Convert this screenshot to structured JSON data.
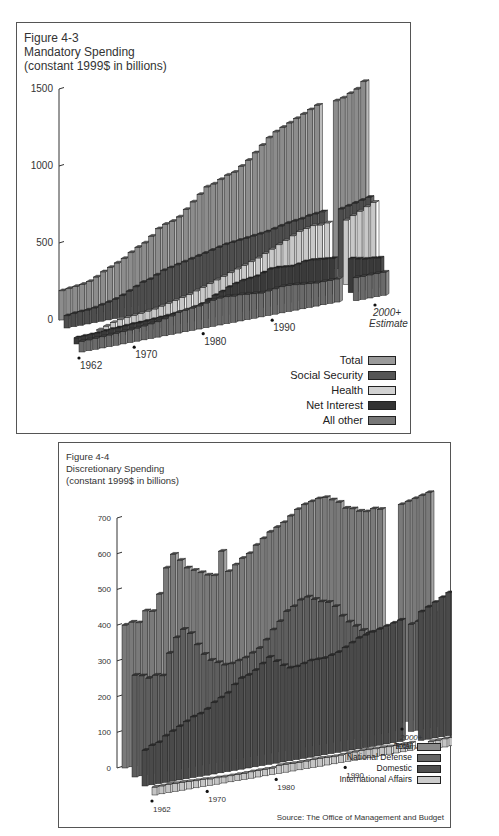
{
  "chart_data": [
    {
      "type": "bar",
      "style": "3d-stacked-depth",
      "figure": "Figure 4-3",
      "title": "Mandatory Spending",
      "subtitle": "(constant 1999$ in billions)",
      "xlabel": "",
      "ylabel": "",
      "ylim": [
        0,
        1500
      ],
      "yticks": [
        0,
        500,
        1000,
        1500
      ],
      "x_tick_labels": [
        "1962",
        "1970",
        "1980",
        "1990",
        "2000+ Estimate"
      ],
      "categories": [
        "1962",
        "1963",
        "1964",
        "1965",
        "1966",
        "1967",
        "1968",
        "1969",
        "1970",
        "1971",
        "1972",
        "1973",
        "1974",
        "1975",
        "1976",
        "1977",
        "1978",
        "1979",
        "1980",
        "1981",
        "1982",
        "1983",
        "1984",
        "1985",
        "1986",
        "1987",
        "1988",
        "1989",
        "1990",
        "1991",
        "1992",
        "1993",
        "1994",
        "1995",
        "1996",
        "1997",
        "1998",
        "1999",
        "2000",
        "2001",
        "2002",
        "2003",
        "2004"
      ],
      "estimate_start": "2000",
      "series": [
        {
          "name": "Total",
          "color": "#8c8c8c",
          "values": [
            190,
            195,
            200,
            205,
            215,
            235,
            260,
            280,
            300,
            320,
            350,
            375,
            395,
            430,
            470,
            490,
            500,
            520,
            560,
            600,
            640,
            680,
            690,
            710,
            730,
            740,
            770,
            800,
            840,
            880,
            920,
            950,
            970,
            990,
            1010,
            1030,
            1050,
            1070,
            1090,
            1100,
            1120,
            1140,
            1180
          ]
        },
        {
          "name": "Social Security",
          "color": "#4d4d4d",
          "values": [
            80,
            85,
            88,
            90,
            95,
            105,
            115,
            125,
            140,
            160,
            180,
            200,
            210,
            230,
            250,
            260,
            270,
            280,
            290,
            300,
            310,
            320,
            330,
            340,
            345,
            350,
            355,
            360,
            365,
            370,
            380,
            390,
            400,
            405,
            410,
            420,
            425,
            430,
            440,
            450,
            460,
            470,
            480
          ]
        },
        {
          "name": "Health",
          "color": "#c8c8c8",
          "values": [
            0,
            0,
            0,
            0,
            5,
            20,
            35,
            45,
            50,
            55,
            60,
            65,
            70,
            80,
            90,
            100,
            110,
            120,
            135,
            150,
            165,
            180,
            195,
            210,
            225,
            240,
            255,
            270,
            290,
            310,
            330,
            350,
            370,
            390,
            400,
            410,
            405,
            410,
            420,
            440,
            460,
            480,
            500
          ]
        },
        {
          "name": "Net Interest",
          "color": "#3a3a3a",
          "values": [
            40,
            42,
            43,
            45,
            47,
            50,
            52,
            55,
            58,
            58,
            60,
            62,
            65,
            68,
            72,
            75,
            80,
            90,
            100,
            120,
            140,
            155,
            175,
            190,
            200,
            205,
            210,
            225,
            240,
            240,
            235,
            230,
            235,
            245,
            245,
            240,
            235,
            230,
            220,
            210,
            200,
            195,
            190
          ]
        },
        {
          "name": "All other",
          "color": "#6a6a6a",
          "values": [
            70,
            70,
            72,
            73,
            75,
            78,
            80,
            82,
            85,
            90,
            95,
            100,
            110,
            120,
            135,
            140,
            145,
            150,
            160,
            170,
            175,
            175,
            170,
            170,
            165,
            160,
            155,
            160,
            165,
            170,
            170,
            165,
            160,
            155,
            150,
            150,
            150,
            150,
            150,
            150,
            150,
            150,
            150
          ]
        }
      ],
      "legend_position": "bottom-right",
      "grid": false
    },
    {
      "type": "bar",
      "style": "3d-stacked-depth",
      "figure": "Figure 4-4",
      "title": "Discretionary Spending",
      "subtitle": "(constant 1999$ in billions)",
      "xlabel": "",
      "ylabel": "",
      "ylim": [
        0,
        700
      ],
      "yticks": [
        0,
        100,
        200,
        300,
        400,
        500,
        600,
        700
      ],
      "x_tick_labels": [
        "1962",
        "1970",
        "1980",
        "1990",
        "2000+ Estimate"
      ],
      "categories": [
        "1962",
        "1963",
        "1964",
        "1965",
        "1966",
        "1967",
        "1968",
        "1969",
        "1970",
        "1971",
        "1972",
        "1973",
        "1974",
        "1975",
        "1976",
        "1977",
        "1978",
        "1979",
        "1980",
        "1981",
        "1982",
        "1983",
        "1984",
        "1985",
        "1986",
        "1987",
        "1988",
        "1989",
        "1990",
        "1991",
        "1992",
        "1993",
        "1994",
        "1995",
        "1996",
        "1997",
        "1998",
        "1999",
        "2000",
        "2001",
        "2002",
        "2003",
        "2004"
      ],
      "estimate_start": "2000",
      "series": [
        {
          "name": "Total",
          "color": "#7a7a7a",
          "values": [
            400,
            405,
            400,
            430,
            425,
            470,
            540,
            575,
            555,
            530,
            520,
            510,
            500,
            495,
            560,
            500,
            515,
            530,
            540,
            560,
            575,
            590,
            600,
            610,
            625,
            640,
            650,
            655,
            660,
            660,
            650,
            640,
            620,
            615,
            605,
            600,
            605,
            600,
            610,
            615,
            620,
            625,
            630
          ]
        },
        {
          "name": "National Defense",
          "color": "#5e5e5e",
          "values": [
            285,
            280,
            270,
            275,
            270,
            330,
            370,
            390,
            375,
            340,
            310,
            290,
            280,
            270,
            270,
            275,
            280,
            290,
            300,
            320,
            345,
            365,
            390,
            400,
            415,
            420,
            410,
            400,
            395,
            380,
            350,
            330,
            315,
            300,
            290,
            285,
            285,
            290,
            300,
            305,
            310,
            315,
            320
          ]
        },
        {
          "name": "Domestic",
          "color": "#4a4a4a",
          "values": [
            100,
            110,
            115,
            130,
            140,
            150,
            160,
            170,
            175,
            185,
            200,
            210,
            220,
            240,
            255,
            260,
            270,
            285,
            300,
            285,
            270,
            260,
            260,
            265,
            270,
            270,
            270,
            275,
            280,
            290,
            300,
            310,
            315,
            320,
            325,
            330,
            335,
            340,
            360,
            370,
            380,
            390,
            400
          ]
        },
        {
          "name": "International Affairs",
          "color": "#c4c4c4",
          "values": [
            22,
            22,
            23,
            22,
            22,
            21,
            20,
            20,
            18,
            18,
            17,
            17,
            17,
            17,
            18,
            18,
            18,
            18,
            22,
            22,
            21,
            21,
            21,
            22,
            22,
            21,
            20,
            21,
            22,
            23,
            24,
            23,
            22,
            22,
            21,
            21,
            21,
            21,
            22,
            22,
            23,
            23,
            23
          ]
        }
      ],
      "legend_position": "bottom-right",
      "grid": false,
      "source": "Source: The Office of Management and Budget"
    }
  ],
  "panels": {
    "p1": {
      "figure": "Figure 4-3",
      "title": "Mandatory Spending",
      "subtitle": "(constant 1999$ in billions)",
      "legend": [
        {
          "label": "Total",
          "color": "#9a9a9a"
        },
        {
          "label": "Social Security",
          "color": "#555555"
        },
        {
          "label": "Health",
          "color": "#d2d2d2"
        },
        {
          "label": "Net Interest",
          "color": "#333333"
        },
        {
          "label": "All other",
          "color": "#777777"
        }
      ],
      "estimate_label_1": "2000+",
      "estimate_label_2": "Estimate"
    },
    "p2": {
      "figure": "Figure 4-4",
      "title": "Discretionary Spending",
      "subtitle": "(constant 1999$ in billions)",
      "legend": [
        {
          "label": "Total",
          "color": "#8a8a8a"
        },
        {
          "label": "National Defense",
          "color": "#666666"
        },
        {
          "label": "Domestic",
          "color": "#4f4f4f"
        },
        {
          "label": "International Affairs",
          "color": "#cccccc"
        }
      ],
      "estimate_label_1": "2000+",
      "estimate_label_2": "Estimate",
      "source": "Source: The Office of Management and Budget"
    }
  }
}
